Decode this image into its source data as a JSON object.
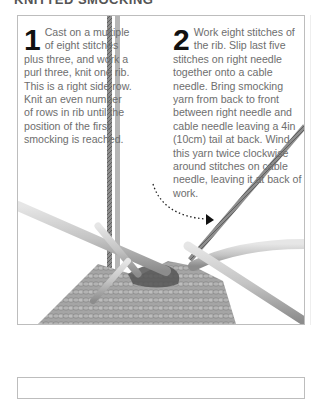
{
  "page": {
    "heading": "KNITTED SMOCKING"
  },
  "steps": [
    {
      "number": "1",
      "text": "Cast on a multiple of eight stitches plus three, and work a purl three, knit one rib. This is a right side row. Knit an even number of rows in rib until the position of the first smocking is reached."
    },
    {
      "number": "2",
      "text": "Work eight stitches of the rib. Slip last five stitches on right needle together onto a cable needle. Bring smocking yarn from back to front between right needle and cable needle leaving a 4in (10cm) tail at back. Wind this yarn twice clockwise around stitches on cable needle, leaving it at back of work."
    }
  ],
  "illustration": {
    "subject": "knitting-needles-with-smocking-yarn",
    "colors": {
      "needle": "#c8c8c8",
      "needle_shadow": "#8a8a8a",
      "yarn": "#9a9a9a",
      "yarn_dark": "#555555",
      "arrow": "#222222",
      "frame_border": "#bdbdbd"
    }
  }
}
